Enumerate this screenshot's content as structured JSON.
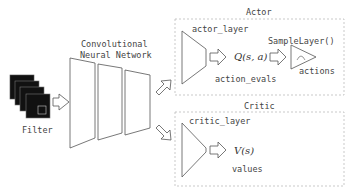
{
  "input": {
    "label": "Filter"
  },
  "cnn": {
    "title_line1": "Convolutional",
    "title_line2": "Neural Network"
  },
  "actor": {
    "title": "Actor",
    "layer_label": "actor_layer",
    "q_expr": "Q(s, a)",
    "output_label": "action_evals",
    "sampler_label": "SampleLayer()",
    "actions_label": "actions"
  },
  "critic": {
    "title": "Critic",
    "layer_label": "critic_layer",
    "v_expr": "V(s)",
    "output_label": "values"
  },
  "colors": {
    "stroke": "#555555",
    "dashed_box": "#bbbbbb",
    "filter_fill": "#111111"
  }
}
